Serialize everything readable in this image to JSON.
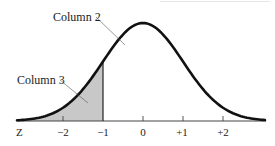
{
  "diagram": {
    "type": "normal-distribution-curve",
    "labels": {
      "column2": "Column 2",
      "column3": "Column 3",
      "axis_name": "Z"
    },
    "ticks": [
      {
        "value": -2,
        "label": "−2"
      },
      {
        "value": -1,
        "label": "−1"
      },
      {
        "value": 0,
        "label": "0"
      },
      {
        "value": 1,
        "label": "+1"
      },
      {
        "value": 2,
        "label": "+2"
      }
    ],
    "shaded_region": {
      "from": "-inf",
      "to": -1
    },
    "colors": {
      "curve": "#111111",
      "shade": "#c8c8c8",
      "axis": "#333333",
      "background": "#ffffff"
    }
  },
  "chart_data": {
    "type": "area",
    "title": "",
    "xlabel": "Z",
    "ylabel": "",
    "x_ticks": [
      -2,
      -1,
      0,
      1,
      2
    ],
    "x_tick_labels": [
      "−2",
      "−1",
      "0",
      "+1",
      "+2"
    ],
    "series": [
      {
        "name": "Standard normal density",
        "function": "exp(-z^2/2)/sqrt(2*pi)"
      },
      {
        "name": "Shaded tail area (Column 3)",
        "range": [
          -3.5,
          -1
        ]
      }
    ],
    "annotations": [
      "Column 2",
      "Column 3"
    ],
    "grid": false
  }
}
